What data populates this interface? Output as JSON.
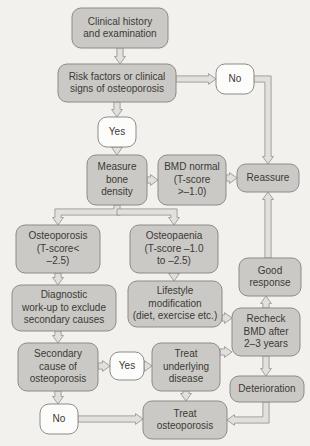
{
  "diagram": {
    "background_color": "#f3f1ee",
    "box_fill_color": "#cbc9c5",
    "box_open_color": "#fcfcfb",
    "border_color": "#8d8b88",
    "text_color": "#3b3936",
    "connector_fill": "#e2e0dd",
    "nodes": [
      {
        "id": "clinical-history",
        "style": "filled",
        "x": 72,
        "y": 8,
        "w": 96,
        "h": 40,
        "font_size": 10,
        "lines": [
          "Clinical history",
          "and examination"
        ]
      },
      {
        "id": "risk-factors",
        "style": "filled",
        "x": 58,
        "y": 64,
        "w": 118,
        "h": 38,
        "font_size": 10,
        "lines": [
          "Risk factors or clinical",
          "signs of osteoporosis"
        ]
      },
      {
        "id": "no-top",
        "style": "open",
        "x": 216,
        "y": 64,
        "w": 38,
        "h": 30,
        "font_size": 10,
        "lines": [
          "No"
        ]
      },
      {
        "id": "yes-top",
        "style": "open",
        "x": 98,
        "y": 117,
        "w": 38,
        "h": 30,
        "font_size": 10,
        "lines": [
          "Yes"
        ]
      },
      {
        "id": "measure-bone-density",
        "style": "filled",
        "x": 87,
        "y": 155,
        "w": 60,
        "h": 50,
        "font_size": 10,
        "lines": [
          "Measure",
          "bone",
          "density"
        ]
      },
      {
        "id": "bmd-normal",
        "style": "filled",
        "x": 158,
        "y": 155,
        "w": 68,
        "h": 50,
        "font_size": 10,
        "lines": [
          "BMD normal",
          "(T-score",
          ">–1.0)"
        ]
      },
      {
        "id": "reassure",
        "style": "filled",
        "x": 237,
        "y": 164,
        "w": 62,
        "h": 28,
        "font_size": 10,
        "lines": [
          "Reassure"
        ]
      },
      {
        "id": "osteoporosis",
        "style": "filled",
        "x": 16,
        "y": 225,
        "w": 84,
        "h": 48,
        "font_size": 10,
        "lines": [
          "Osteoporosis",
          "(T-score<",
          "–2.5)"
        ]
      },
      {
        "id": "osteopaenia",
        "style": "filled",
        "x": 130,
        "y": 225,
        "w": 88,
        "h": 48,
        "font_size": 10,
        "lines": [
          "Osteopaenia",
          "(T-score –1.0",
          "to –2.5)"
        ]
      },
      {
        "id": "diagnostic-workup",
        "style": "filled",
        "x": 12,
        "y": 285,
        "w": 104,
        "h": 46,
        "font_size": 10,
        "lines": [
          "Diagnostic",
          "work-up to exclude",
          "secondary causes"
        ]
      },
      {
        "id": "lifestyle-modification",
        "style": "filled",
        "x": 128,
        "y": 281,
        "w": 94,
        "h": 46,
        "font_size": 10,
        "lines": [
          "Lifestyle",
          "modification",
          "(diet, exercise etc.)"
        ]
      },
      {
        "id": "good-response",
        "style": "filled",
        "x": 239,
        "y": 258,
        "w": 62,
        "h": 38,
        "font_size": 10,
        "lines": [
          "Good",
          "response"
        ]
      },
      {
        "id": "recheck-bmd",
        "style": "filled",
        "x": 232,
        "y": 308,
        "w": 68,
        "h": 48,
        "font_size": 10,
        "lines": [
          "Recheck",
          "BMD after",
          "2–3 years"
        ]
      },
      {
        "id": "secondary-cause",
        "style": "filled",
        "x": 18,
        "y": 343,
        "w": 80,
        "h": 48,
        "font_size": 10,
        "lines": [
          "Secondary",
          "cause of",
          "osteoporosis"
        ]
      },
      {
        "id": "yes-bottom",
        "style": "open",
        "x": 110,
        "y": 352,
        "w": 34,
        "h": 28,
        "font_size": 10,
        "lines": [
          "Yes"
        ]
      },
      {
        "id": "treat-underlying",
        "style": "filled",
        "x": 152,
        "y": 343,
        "w": 68,
        "h": 48,
        "font_size": 10,
        "lines": [
          "Treat",
          "underlying",
          "disease"
        ]
      },
      {
        "id": "deterioration",
        "style": "filled",
        "x": 230,
        "y": 376,
        "w": 74,
        "h": 26,
        "font_size": 10,
        "lines": [
          "Deterioration"
        ]
      },
      {
        "id": "no-bottom",
        "style": "open",
        "x": 40,
        "y": 404,
        "w": 38,
        "h": 30,
        "font_size": 10,
        "lines": [
          "No"
        ]
      },
      {
        "id": "treat-osteoporosis",
        "style": "filled",
        "x": 143,
        "y": 401,
        "w": 84,
        "h": 38,
        "font_size": 10,
        "lines": [
          "Treat",
          "osteoporosis"
        ]
      }
    ],
    "connectors": [
      {
        "id": "clinical-history-to-risk-factors",
        "dir": "down",
        "points": "120,48 120,64"
      },
      {
        "id": "risk-factors-to-no",
        "dir": "right",
        "points": "176,79 216,79"
      },
      {
        "id": "risk-factors-to-yes",
        "dir": "down",
        "points": "117,102 117,117"
      },
      {
        "id": "no-to-reassure",
        "dir": "down",
        "points": "254,79 268,79 268,164"
      },
      {
        "id": "yes-to-measure",
        "dir": "down",
        "points": "117,147 117,155"
      },
      {
        "id": "measure-to-bmd-normal",
        "dir": "right",
        "points": "147,180 158,180"
      },
      {
        "id": "bmd-normal-to-reassure",
        "dir": "right",
        "points": "226,178 237,178"
      },
      {
        "id": "good-response-to-reassure",
        "dir": "up",
        "points": "268,258 268,192"
      },
      {
        "id": "measure-to-osteoporosis",
        "dir": "down",
        "points": "117,205 117,212 58,212 58,225"
      },
      {
        "id": "measure-to-osteopaenia",
        "dir": "down",
        "points": "117,212 174,212 174,225"
      },
      {
        "id": "osteoporosis-to-diagnostic",
        "dir": "down",
        "points": "58,273 58,285"
      },
      {
        "id": "osteopaenia-to-lifestyle",
        "dir": "down",
        "points": "174,273 174,281"
      },
      {
        "id": "diagnostic-to-secondary",
        "dir": "down",
        "points": "58,331 58,343"
      },
      {
        "id": "lifestyle-to-recheck",
        "dir": "right",
        "points": "222,318 232,318"
      },
      {
        "id": "secondary-to-yes",
        "dir": "right",
        "points": "98,366 110,366"
      },
      {
        "id": "yes-to-treat-underlying",
        "dir": "right",
        "points": "144,366 152,366"
      },
      {
        "id": "secondary-to-no",
        "dir": "down",
        "points": "58,391 58,404"
      },
      {
        "id": "treat-underlying-to-recheck",
        "dir": "right",
        "points": "220,352 232,352"
      },
      {
        "id": "treat-underlying-to-treat-osteo",
        "dir": "down",
        "points": "186,391 186,401"
      },
      {
        "id": "recheck-to-good-response",
        "dir": "up",
        "points": "266,308 266,296"
      },
      {
        "id": "recheck-to-deterioration",
        "dir": "down",
        "points": "266,356 266,376"
      },
      {
        "id": "no-to-treat-osteoporosis",
        "dir": "right",
        "points": "78,419 143,419"
      },
      {
        "id": "deterioration-to-treat-osteo",
        "dir": "left",
        "points": "266,402 266,420 227,420"
      }
    ]
  }
}
